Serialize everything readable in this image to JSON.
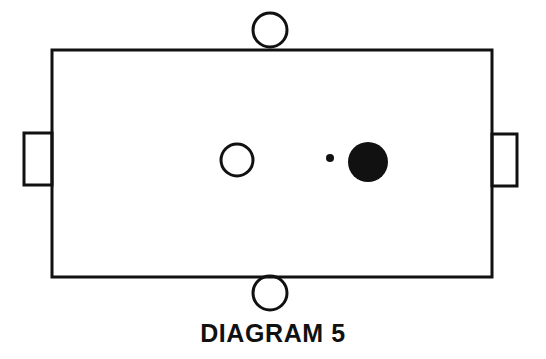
{
  "figure": {
    "caption": "DIAGRAM 5",
    "background_color": "#ffffff",
    "stroke_color": "#111111",
    "fill_color": "#111111",
    "canvas": {
      "width": 546,
      "height": 359
    }
  },
  "shapes": {
    "main_body": {
      "label": "main-rectangle",
      "x": 52,
      "y": 50,
      "width": 440,
      "height": 227,
      "stroke_width": 3,
      "filled": false
    },
    "left_tab": {
      "label": "left-side-tab",
      "x": 24,
      "y": 133,
      "width": 28,
      "height": 52,
      "stroke_width": 3,
      "filled": false
    },
    "right_tab": {
      "label": "right-side-tab",
      "x": 492,
      "y": 134,
      "width": 25,
      "height": 52,
      "stroke_width": 3,
      "filled": false
    },
    "top_circle": {
      "label": "top-open-circle",
      "cx": 270,
      "cy": 30,
      "r": 17,
      "stroke_width": 3,
      "filled": false
    },
    "bottom_circle": {
      "label": "bottom-open-circle",
      "cx": 270,
      "cy": 293,
      "r": 17,
      "stroke_width": 3,
      "filled": false
    },
    "inner_open_circle": {
      "label": "interior-open-circle",
      "cx": 237,
      "cy": 160,
      "r": 16,
      "stroke_width": 3,
      "filled": false
    },
    "small_dot": {
      "label": "interior-small-filled-dot",
      "cx": 330,
      "cy": 158,
      "r": 4,
      "filled": true
    },
    "large_dot": {
      "label": "interior-large-filled-circle",
      "cx": 368,
      "cy": 162,
      "r": 20,
      "filled": true
    }
  }
}
